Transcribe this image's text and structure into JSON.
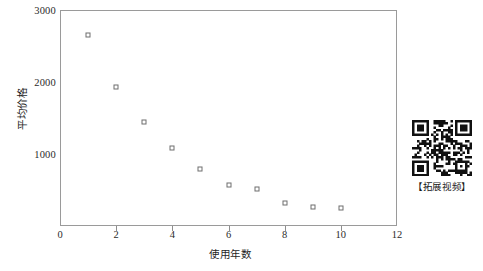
{
  "chart_data": {
    "type": "scatter",
    "title": "",
    "xlabel": "使用年数",
    "ylabel": "平均价格",
    "xlim": [
      0,
      12
    ],
    "ylim": [
      0,
      3000
    ],
    "grid": false,
    "legend": null,
    "marker": "open-square",
    "marker_color": "#6e6e6e",
    "x": [
      1,
      2,
      3,
      4,
      5,
      6,
      7,
      8,
      9,
      10
    ],
    "values": [
      2650,
      1930,
      1450,
      1080,
      790,
      570,
      510,
      320,
      270,
      250
    ],
    "points": [
      {
        "x": 1,
        "y": 2650
      },
      {
        "x": 2,
        "y": 1930
      },
      {
        "x": 3,
        "y": 1450
      },
      {
        "x": 4,
        "y": 1080
      },
      {
        "x": 5,
        "y": 790
      },
      {
        "x": 6,
        "y": 570
      },
      {
        "x": 7,
        "y": 510
      },
      {
        "x": 8,
        "y": 320
      },
      {
        "x": 9,
        "y": 270
      },
      {
        "x": 10,
        "y": 250
      }
    ],
    "xticks": [
      0,
      2,
      4,
      6,
      8,
      10,
      12
    ],
    "xtick_labels": [
      "0",
      "2",
      "4",
      "6",
      "8",
      "10",
      "12"
    ],
    "yticks": [
      1000,
      2000,
      3000
    ],
    "ytick_labels": [
      "1000",
      "2000",
      "3000"
    ]
  },
  "qr": {
    "caption": "【拓展视频】",
    "icon": "qr-code-icon"
  },
  "colors": {
    "axis": "#9a9a9a",
    "tick": "#8d8d8d",
    "marker_stroke": "#6e6e6e",
    "text": "#1f1f1f",
    "background": "#ffffff"
  }
}
